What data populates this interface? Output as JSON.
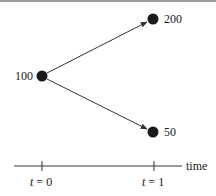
{
  "diagram": {
    "type": "binomial-tree",
    "nodes": [
      {
        "id": "root",
        "label": "100",
        "time": 0
      },
      {
        "id": "up",
        "label": "200",
        "time": 1
      },
      {
        "id": "down",
        "label": "50",
        "time": 1
      }
    ],
    "edges": [
      {
        "from": "root",
        "to": "up"
      },
      {
        "from": "root",
        "to": "down"
      }
    ],
    "axis": {
      "label": "time",
      "ticks": [
        {
          "var": "t",
          "eq": "=",
          "value": "0"
        },
        {
          "var": "t",
          "eq": "=",
          "value": "1"
        }
      ]
    },
    "colors": {
      "node": "#1a1a1a",
      "line": "#333333",
      "text": "#1a1a1a"
    }
  }
}
